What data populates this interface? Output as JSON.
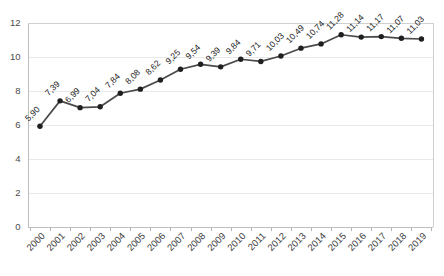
{
  "chart_data": {
    "type": "line",
    "title": "",
    "subtitle": "",
    "xlabel": "",
    "ylabel": "",
    "categories": [
      "2000",
      "2001",
      "2002",
      "2003",
      "2004",
      "2005",
      "2006",
      "2007",
      "2008",
      "2009",
      "2010",
      "2011",
      "2012",
      "2013",
      "2014",
      "2015",
      "2016",
      "2017",
      "2018",
      "2019"
    ],
    "values": [
      5.9,
      7.39,
      6.99,
      7.04,
      7.84,
      8.08,
      8.62,
      9.25,
      9.54,
      9.39,
      9.84,
      9.71,
      10.03,
      10.49,
      10.74,
      11.28,
      11.14,
      11.17,
      11.07,
      11.03
    ],
    "data_labels": [
      "5,90",
      "7,39",
      "6,99",
      "7,04",
      "7,84",
      "8,08",
      "8,62",
      "9,25",
      "9,54",
      "9,39",
      "9,84",
      "9,71",
      "10,03",
      "10,49",
      "10,74",
      "11,28",
      "11,14",
      "11,17",
      "11,07",
      "11,03"
    ],
    "ylim": [
      0,
      12
    ],
    "ytick_values": [
      0,
      2,
      4,
      6,
      8,
      10,
      12
    ],
    "ytick_labels": [
      "0",
      "2",
      "4",
      "6",
      "8",
      "10",
      "12"
    ],
    "grid": true,
    "grid_axis": "y",
    "legend": false,
    "legend_position": "none",
    "marker": "circle",
    "series": [
      {
        "name": "series-1",
        "values": [
          5.9,
          7.39,
          6.99,
          7.04,
          7.84,
          8.08,
          8.62,
          9.25,
          9.54,
          9.39,
          9.84,
          9.71,
          10.03,
          10.49,
          10.74,
          11.28,
          11.14,
          11.17,
          11.07,
          11.03
        ]
      }
    ]
  },
  "colors": {
    "line": "#4a4a4a",
    "marker": "#1f1f1f",
    "grid": "#e9e9e9",
    "axis": "#bdbdbd",
    "label_text": "#1c1c1c",
    "tick_text": "#3d3d3d",
    "background": "#ffffff"
  }
}
